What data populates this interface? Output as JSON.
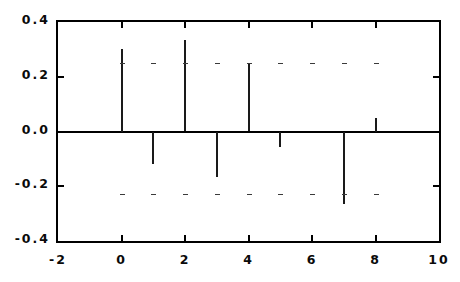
{
  "chart_data": {
    "type": "bar",
    "title": "",
    "subtitle": "",
    "xlabel": "",
    "ylabel": "",
    "xlim": [
      -2,
      10
    ],
    "ylim": [
      -0.4,
      0.4
    ],
    "grid": true,
    "legend": null,
    "annotations": [],
    "x": [
      0,
      1,
      2,
      3,
      4,
      5,
      6,
      7,
      8
    ],
    "values": [
      0.3,
      -0.12,
      0.335,
      -0.165,
      0.245,
      -0.058,
      0.0,
      -0.266,
      0.05
    ],
    "series": [
      {
        "name": "stem-series",
        "x": [
          0,
          1,
          2,
          3,
          4,
          5,
          6,
          7,
          8
        ],
        "values": [
          0.3,
          -0.12,
          0.335,
          -0.165,
          0.245,
          -0.058,
          0.0,
          -0.266,
          0.05
        ]
      }
    ],
    "x_ticks": [
      -2,
      0,
      2,
      4,
      6,
      8,
      10
    ],
    "x_tick_labels": [
      "-2",
      "0",
      "2",
      "4",
      "6",
      "8",
      "10"
    ],
    "y_ticks": [
      -0.4,
      -0.2,
      0.0,
      0.2,
      0.4
    ],
    "y_tick_labels": [
      "-0.4",
      "-0.2",
      "0.0",
      "0.2",
      "0.4"
    ],
    "gridmark_y": [
      0.25,
      -0.23
    ],
    "gridmark_x": [
      0,
      1,
      2,
      3,
      4,
      5,
      6,
      7,
      8
    ],
    "colors": {
      "stem": "#1a1a1a",
      "axis": "#000000",
      "grid": "#3a3a3a",
      "background": "#ffffff",
      "text": "#0a0a0a"
    }
  }
}
